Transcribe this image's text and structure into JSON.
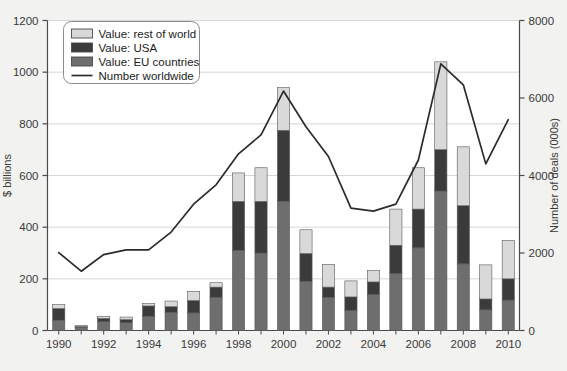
{
  "chart_data": {
    "type": "bar",
    "title": "",
    "subtitle": "",
    "xlabel": "",
    "ylabel": "$ billions",
    "y2label": "Number of deals (000s)",
    "ylim": [
      0,
      1200
    ],
    "y2lim": [
      0,
      8000
    ],
    "grid": true,
    "legend_position": "top-left",
    "stacked": true,
    "categories": [
      "1990",
      "1991",
      "1992",
      "1993",
      "1994",
      "1995",
      "1996",
      "1997",
      "1998",
      "1999",
      "2000",
      "2001",
      "2002",
      "2003",
      "2004",
      "2005",
      "2006",
      "2007",
      "2008",
      "2009",
      "2010"
    ],
    "x_tick_labels": [
      "1990",
      "1992",
      "1994",
      "1996",
      "1998",
      "2000",
      "2002",
      "2004",
      "2006",
      "2008",
      "2010"
    ],
    "y_tick_labels": [
      "0",
      "200",
      "400",
      "600",
      "800",
      "1000",
      "1200"
    ],
    "y2_tick_labels": [
      "0",
      "2000",
      "4000",
      "6000",
      "8000"
    ],
    "series": [
      {
        "name": "Value: EU countries",
        "color": "#6e6e6e",
        "axis": "left",
        "values": [
          40,
          12,
          34,
          30,
          55,
          70,
          68,
          128,
          310,
          300,
          500,
          190,
          128,
          78,
          140,
          220,
          320,
          540,
          258,
          80,
          118
        ]
      },
      {
        "name": "Value: USA",
        "color": "#3b3b3b",
        "axis": "left",
        "values": [
          45,
          3,
          13,
          12,
          40,
          22,
          48,
          40,
          190,
          200,
          275,
          108,
          40,
          52,
          48,
          110,
          150,
          160,
          225,
          42,
          82
        ]
      },
      {
        "name": "Value: rest of world",
        "color": "#d9d9d9",
        "axis": "left",
        "values": [
          15,
          5,
          8,
          10,
          9,
          22,
          35,
          17,
          110,
          130,
          165,
          92,
          88,
          62,
          44,
          140,
          160,
          340,
          228,
          132,
          148
        ]
      }
    ],
    "totals": [
      100,
      20,
      55,
      52,
      104,
      114,
      151,
      185,
      610,
      630,
      940,
      390,
      256,
      192,
      232,
      470,
      630,
      1040,
      711,
      254,
      348
    ],
    "line_series": {
      "name": "Number worldwide",
      "color": "#2b2b2b",
      "axis": "right",
      "values": [
        2010,
        1530,
        1960,
        2080,
        2080,
        2540,
        3260,
        3760,
        4560,
        5050,
        6180,
        5260,
        4490,
        3160,
        3080,
        3260,
        4400,
        6880,
        6340,
        4300,
        5440
      ]
    }
  },
  "legend": {
    "items": [
      {
        "label": "Value: rest of world",
        "marker": "swatch",
        "color": "#d9d9d9"
      },
      {
        "label": "Value: USA",
        "marker": "swatch",
        "color": "#3b3b3b"
      },
      {
        "label": "Value: EU countries",
        "marker": "swatch",
        "color": "#6e6e6e"
      },
      {
        "label": "Number worldwide",
        "marker": "line",
        "color": "#2b2b2b"
      }
    ]
  },
  "axes": {
    "left_title": "$ billions",
    "right_title": "Number of deals (000s)"
  }
}
